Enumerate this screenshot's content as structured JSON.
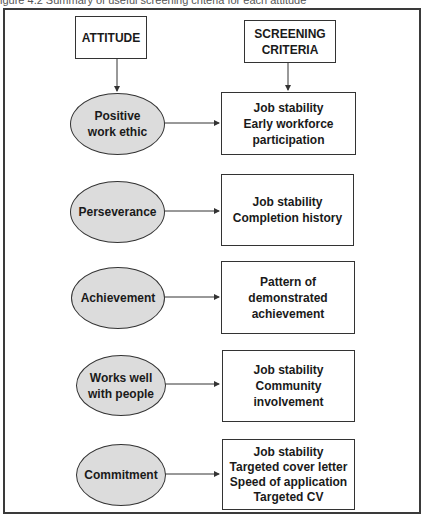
{
  "caption": "igure 4.2 Summary of useful screening criteria for each attitude",
  "headers": {
    "attitude": "ATTITUDE",
    "criteria_line1": "SCREENING",
    "criteria_line2": "CRITERIA"
  },
  "rows": [
    {
      "attitude": [
        "Positive",
        "work ethic"
      ],
      "criteria": [
        "Job stability",
        "Early workforce",
        "participation"
      ]
    },
    {
      "attitude": [
        "Perseverance"
      ],
      "criteria": [
        "Job stability",
        "Completion history"
      ]
    },
    {
      "attitude": [
        "Achievement"
      ],
      "criteria": [
        "Pattern of",
        "demonstrated",
        "achievement"
      ]
    },
    {
      "attitude": [
        "Works well",
        "with people"
      ],
      "criteria": [
        "Job stability",
        "Community",
        "involvement"
      ]
    },
    {
      "attitude": [
        "Commitment"
      ],
      "criteria": [
        "Job stability",
        "Targeted cover letter",
        "Speed of application",
        "Targeted CV"
      ]
    }
  ],
  "colors": {
    "ellipse_fill": "#dcdcdc",
    "stroke": "#333333",
    "background": "#ffffff"
  }
}
